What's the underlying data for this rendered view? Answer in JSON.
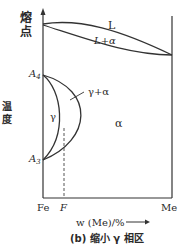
{
  "diagram": {
    "y_axis_label_top": "熔点",
    "y_axis_label_top_chars": [
      "熔",
      "点"
    ],
    "y_axis_label_mid_chars": [
      "温",
      "度"
    ],
    "regions": {
      "liquid": "L",
      "liquid_alpha": "L+α",
      "gamma": "γ",
      "gamma_alpha": "γ+α",
      "alpha": "α"
    },
    "points": {
      "A4": {
        "main": "A",
        "sub": "4"
      },
      "A3": {
        "main": "A",
        "sub": "3"
      }
    },
    "x_axis": {
      "left_label": "Fe",
      "mark_label": "F",
      "right_label": "Me",
      "title": "w (Me)/%"
    },
    "caption": "(b) 缩小 γ 相区"
  }
}
